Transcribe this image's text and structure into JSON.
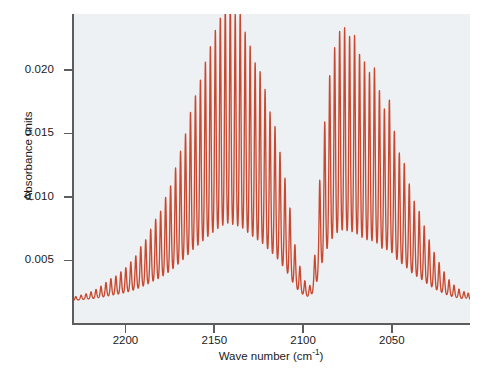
{
  "chart_data": {
    "type": "line",
    "title": "",
    "subtitle": "",
    "xlabel": "Wave number (cm",
    "xlabel_sup": "-1",
    "xlabel_tail": ")",
    "xlabel_full": "Wave number (cm^-1)",
    "ylabel": "Absorbance units",
    "xlim": [
      2229,
      2006
    ],
    "ylim": [
      0.0,
      0.0244
    ],
    "x_inverted": true,
    "grid": false,
    "legend": null,
    "line_color": "#c8492f",
    "plot_background": "#edf1f4",
    "axis_color": "#5d5d5d",
    "xticks": [
      2200,
      2150,
      2100,
      2050
    ],
    "xtick_labels": [
      "2200",
      "2150",
      "2100",
      "2050"
    ],
    "yticks": [
      0.005,
      0.01,
      0.015,
      0.02
    ],
    "ytick_labels": [
      "0.005",
      "0.010",
      "0.015",
      "0.020"
    ],
    "baseline": 0.0018,
    "band_centre": 2143,
    "line_width": 1.4,
    "peaks": [
      {
        "x": 2228.0,
        "y": 0.00215
      },
      {
        "x": 2225.0,
        "y": 0.00225
      },
      {
        "x": 2222.2,
        "y": 0.00235
      },
      {
        "x": 2219.4,
        "y": 0.0025
      },
      {
        "x": 2216.6,
        "y": 0.00268
      },
      {
        "x": 2213.8,
        "y": 0.00292
      },
      {
        "x": 2211.0,
        "y": 0.0032
      },
      {
        "x": 2208.2,
        "y": 0.0035
      },
      {
        "x": 2205.4,
        "y": 0.00368
      },
      {
        "x": 2202.6,
        "y": 0.004
      },
      {
        "x": 2199.8,
        "y": 0.0043
      },
      {
        "x": 2197.0,
        "y": 0.00475
      },
      {
        "x": 2194.2,
        "y": 0.0052
      },
      {
        "x": 2191.4,
        "y": 0.0059
      },
      {
        "x": 2188.6,
        "y": 0.0064
      },
      {
        "x": 2185.8,
        "y": 0.0072
      },
      {
        "x": 2183.0,
        "y": 0.00795
      },
      {
        "x": 2180.2,
        "y": 0.00855
      },
      {
        "x": 2177.4,
        "y": 0.0096
      },
      {
        "x": 2174.6,
        "y": 0.01045
      },
      {
        "x": 2171.8,
        "y": 0.0118
      },
      {
        "x": 2169.0,
        "y": 0.01305
      },
      {
        "x": 2166.2,
        "y": 0.01435
      },
      {
        "x": 2163.4,
        "y": 0.016
      },
      {
        "x": 2160.6,
        "y": 0.01725
      },
      {
        "x": 2157.8,
        "y": 0.0184
      },
      {
        "x": 2155.0,
        "y": 0.01975
      },
      {
        "x": 2152.2,
        "y": 0.0209
      },
      {
        "x": 2149.4,
        "y": 0.02215
      },
      {
        "x": 2146.6,
        "y": 0.0231
      },
      {
        "x": 2143.8,
        "y": 0.024
      },
      {
        "x": 2141.0,
        "y": 0.02435
      },
      {
        "x": 2138.2,
        "y": 0.0233
      },
      {
        "x": 2135.4,
        "y": 0.0235
      },
      {
        "x": 2132.6,
        "y": 0.022
      },
      {
        "x": 2129.8,
        "y": 0.021
      },
      {
        "x": 2127.0,
        "y": 0.0197
      },
      {
        "x": 2124.2,
        "y": 0.01905
      },
      {
        "x": 2121.4,
        "y": 0.0177
      },
      {
        "x": 2118.6,
        "y": 0.016
      },
      {
        "x": 2115.8,
        "y": 0.01495
      },
      {
        "x": 2113.0,
        "y": 0.013
      },
      {
        "x": 2110.2,
        "y": 0.01105
      },
      {
        "x": 2107.4,
        "y": 0.0088
      },
      {
        "x": 2104.6,
        "y": 0.006
      },
      {
        "x": 2101.8,
        "y": 0.0044
      },
      {
        "x": 2099.0,
        "y": 0.0033
      },
      {
        "x": 2096.2,
        "y": 0.0029
      },
      {
        "x": 2093.4,
        "y": 0.00515
      },
      {
        "x": 2090.6,
        "y": 0.0109
      },
      {
        "x": 2087.8,
        "y": 0.0153
      },
      {
        "x": 2085.0,
        "y": 0.0188
      },
      {
        "x": 2082.2,
        "y": 0.0209
      },
      {
        "x": 2079.4,
        "y": 0.0221
      },
      {
        "x": 2076.6,
        "y": 0.02235
      },
      {
        "x": 2073.8,
        "y": 0.02165
      },
      {
        "x": 2071.0,
        "y": 0.0218
      },
      {
        "x": 2068.2,
        "y": 0.02035
      },
      {
        "x": 2065.4,
        "y": 0.0198
      },
      {
        "x": 2062.6,
        "y": 0.01895
      },
      {
        "x": 2059.8,
        "y": 0.01935
      },
      {
        "x": 2057.0,
        "y": 0.0176
      },
      {
        "x": 2054.2,
        "y": 0.0162
      },
      {
        "x": 2051.4,
        "y": 0.017
      },
      {
        "x": 2048.6,
        "y": 0.01455
      },
      {
        "x": 2045.8,
        "y": 0.0129
      },
      {
        "x": 2043.0,
        "y": 0.01215
      },
      {
        "x": 2040.2,
        "y": 0.0106
      },
      {
        "x": 2037.4,
        "y": 0.0093
      },
      {
        "x": 2034.6,
        "y": 0.00855
      },
      {
        "x": 2031.8,
        "y": 0.00745
      },
      {
        "x": 2029.0,
        "y": 0.0064
      },
      {
        "x": 2026.2,
        "y": 0.00545
      },
      {
        "x": 2023.4,
        "y": 0.0047
      },
      {
        "x": 2020.6,
        "y": 0.004
      },
      {
        "x": 2017.8,
        "y": 0.0034
      },
      {
        "x": 2015.0,
        "y": 0.003
      },
      {
        "x": 2012.2,
        "y": 0.0027
      },
      {
        "x": 2009.4,
        "y": 0.0025
      },
      {
        "x": 2007.0,
        "y": 0.0024
      }
    ],
    "valley_level": 0.0018
  }
}
